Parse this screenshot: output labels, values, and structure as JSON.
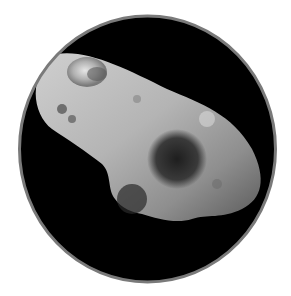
{
  "image": {
    "subject": "asteroid",
    "description": "Grayscale photograph of an elongated cratered asteroid against black space, framed in a circle with a grey border",
    "colors": {
      "background": "#ffffff",
      "space": "#000000",
      "border": "#7a7a7a",
      "surface_light": "#d8d8d8",
      "surface_mid": "#9a9a9a",
      "surface_dark": "#3a3a3a"
    }
  }
}
